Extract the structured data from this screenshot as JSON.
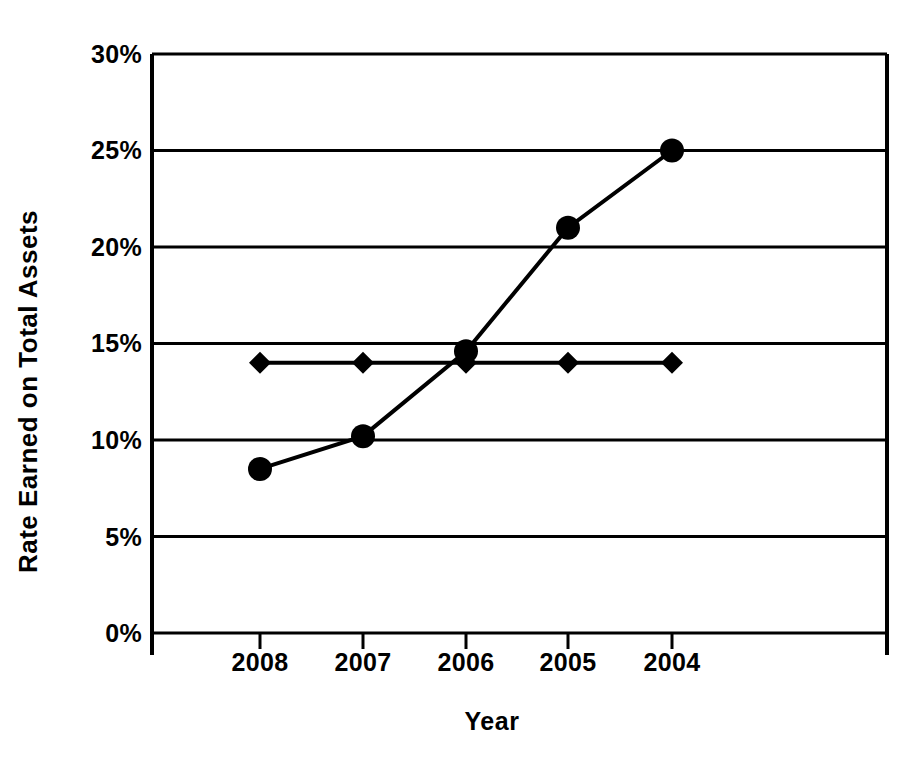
{
  "chart_data": {
    "type": "line",
    "title": "",
    "xlabel": "Year",
    "ylabel": "Rate Earned on Total Assets",
    "categories": [
      "2008",
      "2007",
      "2006",
      "2005",
      "2004"
    ],
    "series": [
      {
        "name": "circle-series",
        "marker": "circle",
        "values": [
          8.5,
          10.2,
          14.6,
          21.0,
          25.0
        ]
      },
      {
        "name": "diamond-series",
        "marker": "diamond",
        "values": [
          14.0,
          14.0,
          14.0,
          14.0,
          14.0
        ]
      }
    ],
    "ylim": [
      0,
      30
    ],
    "y_ticks": [
      0,
      5,
      10,
      15,
      20,
      25,
      30
    ],
    "y_tick_labels": [
      "0%",
      "5%",
      "10%",
      "15%",
      "20%",
      "25%",
      "30%"
    ],
    "x_tick_labels": [
      "2008",
      "2007",
      "2006",
      "2005",
      "2004"
    ],
    "grid": "horizontal",
    "legend": "none",
    "line_color": "#000000",
    "background_color": "#ffffff"
  },
  "axes": {
    "y_title": "Rate Earned on Total Assets",
    "x_title": "Year",
    "y_labels": {
      "t0": "0%",
      "t5": "5%",
      "t10": "10%",
      "t15": "15%",
      "t20": "20%",
      "t25": "25%",
      "t30": "30%"
    },
    "x_labels": {
      "c0": "2008",
      "c1": "2007",
      "c2": "2006",
      "c3": "2005",
      "c4": "2004"
    }
  }
}
